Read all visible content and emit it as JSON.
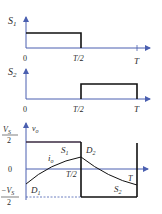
{
  "colors": {
    "axis": "#4a5fb0",
    "waveform": "#111111",
    "vo_top": "#3a2a40",
    "text": "#2a2a2a"
  },
  "plot_s1": {
    "ylabel": "S",
    "ylabel_sub": "1",
    "x_ticks": [
      "0",
      "T/2",
      "T"
    ]
  },
  "plot_s2": {
    "ylabel": "S",
    "ylabel_sub": "2",
    "x_ticks": [
      "0",
      "T/2",
      "T"
    ]
  },
  "plot_vo": {
    "ylabel": "v",
    "ylabel_sub": "o",
    "top_level_num": "V",
    "top_level_num_sub": "S",
    "top_level_den": "2",
    "zero_label": "0",
    "bottom_level_num": "−V",
    "bottom_level_num_sub": "S",
    "bottom_level_den": "2",
    "x_tick_half": "T/2",
    "x_tick_full": "T",
    "current_label": "i",
    "current_label_sub": "o",
    "region_labels": [
      {
        "text": "S",
        "sub": "1"
      },
      {
        "text": "D",
        "sub": "2"
      },
      {
        "text": "D",
        "sub": "1"
      },
      {
        "text": "S",
        "sub": "2"
      }
    ]
  }
}
